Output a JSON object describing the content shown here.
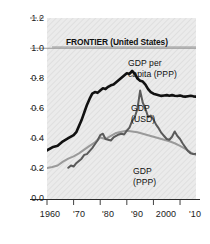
{
  "chart_data": {
    "type": "line",
    "title": "FRONTIER (United States)",
    "xlabel": "",
    "ylabel": "",
    "xlim": [
      1960,
      2016
    ],
    "ylim": [
      0.0,
      1.2
    ],
    "grid": true,
    "legend_position": "inline-annotations",
    "y_ticks": [
      "0.0",
      "0.2",
      "0.4",
      "0.6",
      "0.8",
      "1.0",
      "1.2"
    ],
    "y_tick_values": [
      0.0,
      0.2,
      0.4,
      0.6,
      0.8,
      1.0,
      1.2
    ],
    "x_ticks": [
      "1960",
      "'70",
      "'80",
      "'90",
      "2000",
      "'10"
    ],
    "x_tick_values": [
      1960,
      1970,
      1980,
      1990,
      2000,
      2010
    ],
    "reference_line": 1.0,
    "series": [
      {
        "name": "GDP per capita (PPP)",
        "color": "#111111",
        "width": 2.6,
        "x": [
          1960,
          1962,
          1964,
          1966,
          1968,
          1970,
          1971,
          1972,
          1973,
          1974,
          1975,
          1976,
          1977,
          1978,
          1979,
          1980,
          1981,
          1982,
          1983,
          1984,
          1985,
          1986,
          1987,
          1988,
          1989,
          1990,
          1991,
          1992,
          1993,
          1994,
          1995,
          1996,
          1997,
          1998,
          1999,
          2000,
          2001,
          2002,
          2003,
          2004,
          2005,
          2006,
          2007,
          2008,
          2009,
          2010,
          2011,
          2012,
          2013,
          2014,
          2015,
          2016
        ],
        "values": [
          0.325,
          0.345,
          0.355,
          0.385,
          0.405,
          0.425,
          0.445,
          0.485,
          0.525,
          0.575,
          0.625,
          0.665,
          0.7,
          0.71,
          0.705,
          0.72,
          0.735,
          0.73,
          0.745,
          0.755,
          0.76,
          0.775,
          0.79,
          0.805,
          0.82,
          0.835,
          0.83,
          0.85,
          0.83,
          0.8,
          0.785,
          0.78,
          0.76,
          0.73,
          0.71,
          0.7,
          0.695,
          0.69,
          0.685,
          0.688,
          0.69,
          0.686,
          0.69,
          0.686,
          0.684,
          0.688,
          0.682,
          0.68,
          0.683,
          0.686,
          0.682,
          0.68
        ]
      },
      {
        "name": "GDP (USD)",
        "color": "#5a5a5a",
        "width": 2.0,
        "x": [
          1968,
          1969,
          1970,
          1971,
          1972,
          1973,
          1974,
          1975,
          1976,
          1977,
          1978,
          1979,
          1980,
          1981,
          1982,
          1983,
          1984,
          1985,
          1986,
          1987,
          1988,
          1989,
          1990,
          1991,
          1992,
          1993,
          1994,
          1995,
          1996,
          1997,
          1998,
          1999,
          2000,
          2001,
          2002,
          2003,
          2004,
          2005,
          2006,
          2007,
          2008,
          2009,
          2010,
          2011,
          2012,
          2013,
          2014,
          2015,
          2016
        ],
        "values": [
          0.21,
          0.225,
          0.218,
          0.24,
          0.255,
          0.27,
          0.295,
          0.3,
          0.32,
          0.34,
          0.365,
          0.39,
          0.425,
          0.435,
          0.4,
          0.395,
          0.39,
          0.41,
          0.42,
          0.43,
          0.435,
          0.43,
          0.455,
          0.475,
          0.52,
          0.545,
          0.6,
          0.72,
          0.64,
          0.6,
          0.545,
          0.555,
          0.53,
          0.495,
          0.47,
          0.44,
          0.42,
          0.4,
          0.395,
          0.415,
          0.45,
          0.42,
          0.4,
          0.37,
          0.345,
          0.32,
          0.305,
          0.3,
          0.302
        ]
      },
      {
        "name": "GDP (PPP)",
        "color": "#9a9a9a",
        "width": 2.0,
        "x": [
          1960,
          1962,
          1964,
          1966,
          1968,
          1970,
          1972,
          1974,
          1976,
          1978,
          1980,
          1982,
          1984,
          1986,
          1988,
          1990,
          1992,
          1994,
          1995,
          1996,
          1998,
          2000,
          2002,
          2004,
          2006,
          2008,
          2010,
          2012,
          2014,
          2015,
          2016
        ],
        "values": [
          0.208,
          0.215,
          0.225,
          0.25,
          0.27,
          0.285,
          0.305,
          0.33,
          0.355,
          0.378,
          0.41,
          0.4,
          0.42,
          0.44,
          0.448,
          0.455,
          0.45,
          0.445,
          0.44,
          0.435,
          0.425,
          0.415,
          0.405,
          0.395,
          0.385,
          0.372,
          0.355,
          0.335,
          0.312,
          0.302,
          0.295
        ]
      }
    ],
    "annotations": [
      {
        "text": "FRONTIER (United States)",
        "x": 1985,
        "y": 0.97,
        "style": "bold"
      },
      {
        "text": "GDP per\ncapita (PPP)",
        "x": 1996,
        "y": 0.86
      },
      {
        "text": "GDP\n(USD)",
        "x": 1997,
        "y": 0.6
      },
      {
        "text": "GDP\n(PPP)",
        "x": 1999,
        "y": 0.29
      }
    ]
  },
  "axis_labels": {
    "y": [
      "1.2",
      "1.0",
      "0.8",
      "0.6",
      "0.4",
      "0.2",
      "0.0"
    ],
    "x": [
      "1960",
      "'70",
      "'80",
      "'90",
      "2000",
      "'10"
    ]
  },
  "annotations": {
    "frontier": "FRONTIER (United States)",
    "gdp_per_capita_line1": "GDP per",
    "gdp_per_capita_line2": "capita (PPP)",
    "gdp_usd_line1": "GDP",
    "gdp_usd_line2": "(USD)",
    "gdp_ppp_line1": "GDP",
    "gdp_ppp_line2": "(PPP)"
  },
  "colors": {
    "plot_background": "#e9e9e9",
    "gdp_per_capita": "#111111",
    "gdp_usd": "#5a5a5a",
    "gdp_ppp": "#9a9a9a",
    "axis": "#2b2b2b"
  }
}
